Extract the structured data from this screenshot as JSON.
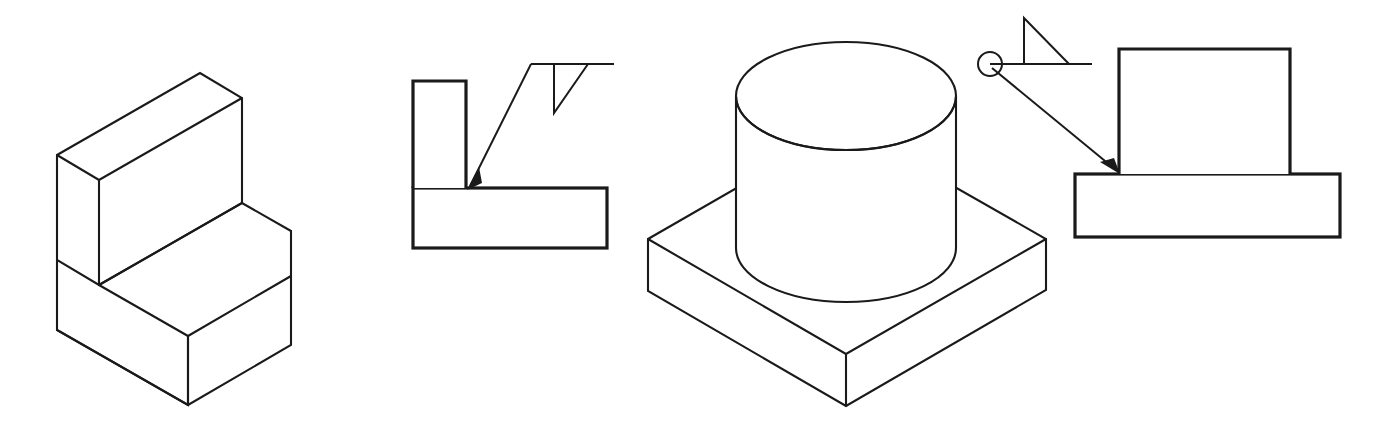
{
  "drawing": {
    "title": "Welding symbol illustration: fillet weld and weld-all-around",
    "background_color": "#ffffff",
    "line_color": "#1a1a1a",
    "figures": [
      {
        "id": "fig-1",
        "name": "isometric-seat-block",
        "caption": "",
        "type": "isometric-pictorial",
        "description": "L-shaped block: horizontal base slab with upright back plate"
      },
      {
        "id": "fig-2",
        "name": "section-tee-joint-fillet",
        "caption": "",
        "type": "section-view",
        "description": "Vertical plate on horizontal plate with fillet weld symbol",
        "weld_symbol": {
          "name": "fillet-weld",
          "triangle_side": "below-reference-line",
          "weld_all_around": false,
          "leader_arrow": true
        }
      },
      {
        "id": "fig-3",
        "name": "isometric-cylinder-on-base",
        "caption": "",
        "type": "isometric-pictorial",
        "description": "Cylindrical boss on square base plate"
      },
      {
        "id": "fig-4",
        "name": "section-boss-on-plate-all-around",
        "caption": "",
        "type": "section-view",
        "description": "Rectangular boss on base plate with weld-all-around symbol",
        "weld_symbol": {
          "name": "fillet-weld",
          "triangle_side": "above-reference-line",
          "weld_all_around": true,
          "leader_arrow": true
        }
      }
    ],
    "icons": {
      "weld_triangle_icon": "fillet-weld-triangle",
      "weld_all_around_icon": "weld-all-around-circle",
      "leader_arrow_icon": "leader-arrow"
    }
  }
}
